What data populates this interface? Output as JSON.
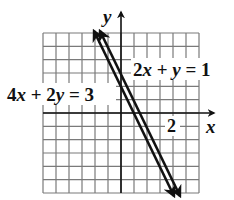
{
  "chart_data": {
    "type": "line",
    "title": "",
    "xlabel": "x",
    "ylabel": "y",
    "xlim": [
      -3,
      3
    ],
    "ylim": [
      -3,
      3
    ],
    "grid": true,
    "grid_step": 0.5,
    "tick_labels": [
      {
        "axis": "x",
        "value": 2,
        "label": "2"
      }
    ],
    "series": [
      {
        "name": "2x + y = 1",
        "equation": "y = 1 - 2x",
        "x": [
          -1,
          2
        ],
        "y": [
          3,
          -3
        ]
      },
      {
        "name": "4x + 2y = 3",
        "equation": "y = 1.5 - 2x",
        "x": [
          -0.75,
          2.25
        ],
        "y": [
          3,
          -3
        ]
      }
    ],
    "annotations": [
      {
        "text": "2x + y = 1",
        "position": "right of line, upper"
      },
      {
        "text": "4x + 2y = 3",
        "position": "left of line, near x-axis"
      }
    ]
  },
  "labels": {
    "y_axis": "y",
    "x_axis": "x",
    "tick_x_2": "2",
    "eq1": {
      "a": "2",
      "var1": "x",
      "plus": " + ",
      "var2": "y",
      "rhs": " = 1"
    },
    "eq2": {
      "a": "4",
      "var1": "x",
      "plus": " + 2",
      "var2": "y",
      "rhs": " = 3"
    }
  }
}
